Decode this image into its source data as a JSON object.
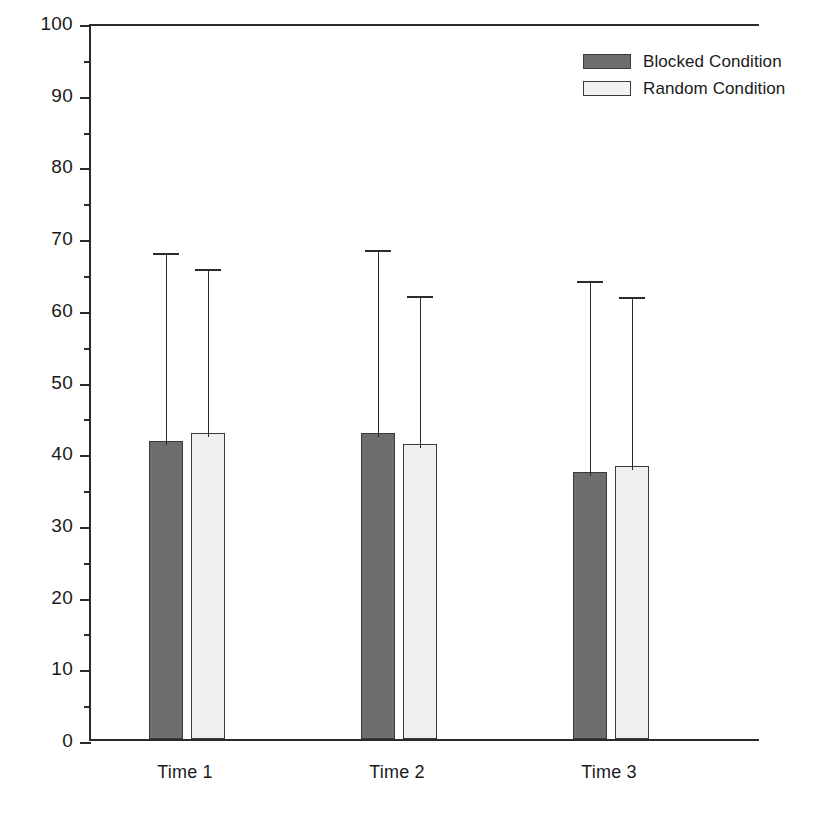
{
  "chart_data": {
    "type": "bar",
    "title": "",
    "subtitle": "",
    "xlabel": "",
    "ylabel": "Overall Mean Percentage of Errors",
    "categories": [
      "Time 1",
      "Time 2",
      "Time 3"
    ],
    "ylim": [
      0,
      100
    ],
    "yticks": [
      0,
      10,
      20,
      30,
      40,
      50,
      60,
      70,
      80,
      90,
      100
    ],
    "ytick_labels": [
      "0",
      "10",
      "20",
      "30",
      "40",
      "50",
      "60",
      "70",
      "80",
      "90",
      "100"
    ],
    "yticks_minor": [
      5,
      15,
      25,
      35,
      45,
      55,
      65,
      75,
      85,
      95
    ],
    "grid": false,
    "legend_position": "top-right",
    "series": [
      {
        "name": "Blocked Condition",
        "color": "#6e6e6e",
        "values": [
          41.5,
          42.7,
          37.3
        ],
        "error_upper": [
          68.3,
          68.8,
          64.4
        ]
      },
      {
        "name": "Random Condition",
        "color": "#efefef",
        "values": [
          42.7,
          41.2,
          38.1
        ],
        "error_upper": [
          66.1,
          62.4,
          62.2
        ]
      }
    ]
  },
  "legend": {
    "items": [
      {
        "label": "Blocked Condition",
        "swatch": "blocked"
      },
      {
        "label": "Random Condition",
        "swatch": "random"
      }
    ]
  },
  "colors": {
    "blocked": "#6e6e6e",
    "random": "#efefef",
    "axis": "#2b2b2b",
    "background": "#ffffff"
  }
}
